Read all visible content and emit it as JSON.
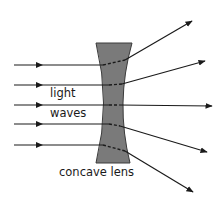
{
  "diagram": {
    "type": "optics",
    "labels": {
      "incoming_top": "light",
      "incoming_bottom": "waves",
      "lens": "concave lens"
    },
    "colors": {
      "lens_fill": "#7a7a7a",
      "lens_stroke": "#3a3a3a",
      "ray": "#1a1a1a",
      "background": "#ffffff"
    },
    "incoming_rays": [
      {
        "y": 65,
        "x1": 14,
        "x2": 105
      },
      {
        "y": 85,
        "x1": 14,
        "x2": 110
      },
      {
        "y": 105,
        "x1": 14,
        "x2": 110
      },
      {
        "y": 124,
        "x1": 14,
        "x2": 110
      },
      {
        "y": 145,
        "x1": 14,
        "x2": 104
      }
    ],
    "outgoing_rays": [
      {
        "x1": 125,
        "y1": 60,
        "x2": 192,
        "y2": 21
      },
      {
        "x1": 122,
        "y1": 84,
        "x2": 205,
        "y2": 61
      },
      {
        "x1": 119,
        "y1": 105,
        "x2": 212,
        "y2": 106
      },
      {
        "x1": 120,
        "y1": 126,
        "x2": 207,
        "y2": 152
      },
      {
        "x1": 125,
        "y1": 151,
        "x2": 193,
        "y2": 192
      }
    ]
  }
}
